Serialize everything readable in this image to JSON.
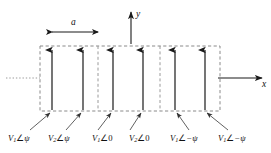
{
  "figure": {
    "name": "phased-array-unit-cell-diagram",
    "axes": {
      "x_label": "x",
      "y_label": "y"
    },
    "dimension": {
      "label": "a",
      "from_element": 1,
      "to_element": 2
    },
    "colors": {
      "stroke": "#111111",
      "dashed_cell": "#8a8a8a",
      "arrow": "#1a1a1a",
      "leader": "#555555",
      "background": "#ffffff"
    },
    "elements": [
      {
        "index": 1,
        "x": 52,
        "label_v": "V",
        "label_sub": "1",
        "angle_glyph": "∠",
        "phase": "ψ"
      },
      {
        "index": 2,
        "x": 83,
        "label_v": "V",
        "label_sub": "2",
        "angle_glyph": "∠",
        "phase": "ψ"
      },
      {
        "index": 3,
        "x": 113,
        "label_v": "V",
        "label_sub": "1",
        "angle_glyph": "∠",
        "phase": "0"
      },
      {
        "index": 4,
        "x": 143,
        "label_v": "V",
        "label_sub": "2",
        "angle_glyph": "∠",
        "phase": "0"
      },
      {
        "index": 5,
        "x": 175,
        "label_v": "V",
        "label_sub": "1",
        "angle_glyph": "∠",
        "phase": "−ψ"
      },
      {
        "index": 6,
        "x": 205,
        "label_v": "V",
        "label_sub": "1",
        "angle_glyph": "∠",
        "phase": "−ψ"
      }
    ],
    "cell_dividers_x": [
      98,
      160
    ],
    "box": {
      "left": 40,
      "right": 220,
      "top": 46,
      "bottom": 111
    },
    "dotted_lead_in": {
      "from_x": 6,
      "to_x": 40,
      "y": 78
    },
    "labels": {
      "l1": "V₁∠0",
      "l2": "V₂∠0"
    }
  }
}
